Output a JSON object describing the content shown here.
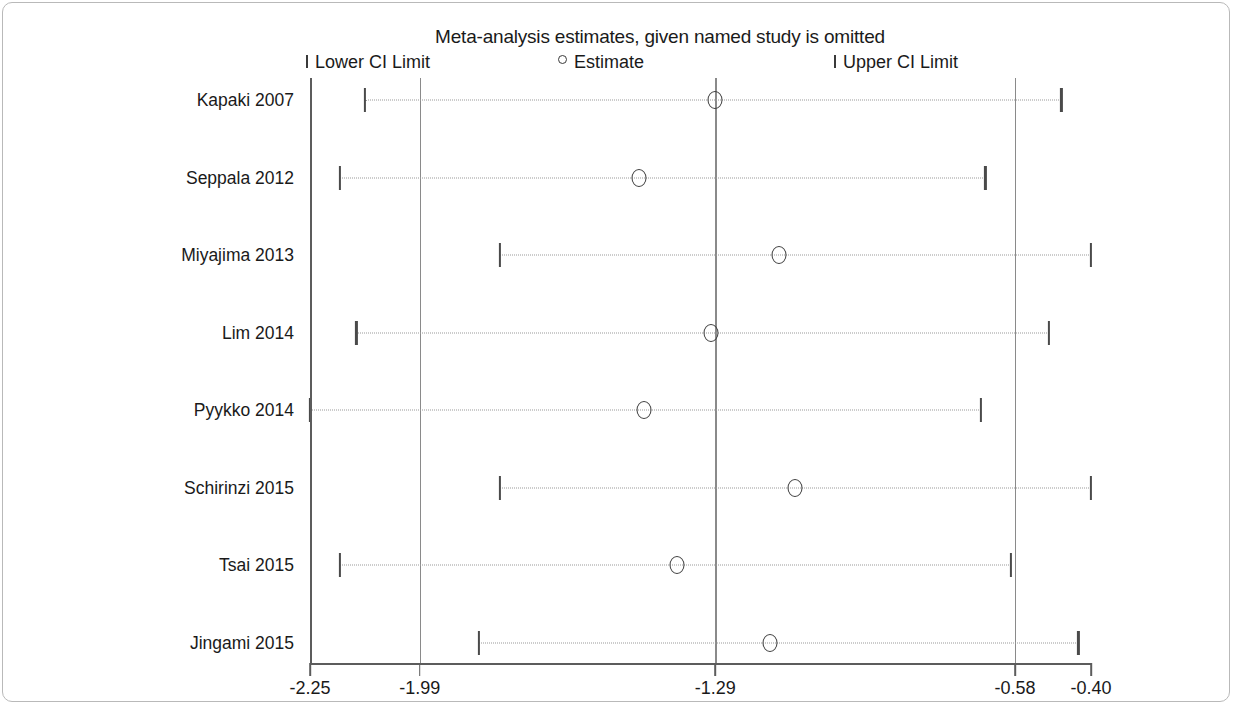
{
  "chart_data": {
    "type": "scatter",
    "title": "Meta-analysis estimates, given named study is omitted",
    "subtype": "leave-one-out influence plot",
    "xlabel": "",
    "ylabel": "",
    "grid": false,
    "legend_position": "top",
    "legend": [
      {
        "marker": "tick",
        "label": "Lower CI Limit"
      },
      {
        "marker": "circle",
        "label": "Estimate"
      },
      {
        "marker": "tick",
        "label": "Upper CI Limit"
      }
    ],
    "xlim": [
      -2.25,
      -0.4
    ],
    "xticks": [
      -2.25,
      -1.99,
      -1.29,
      -0.58,
      -0.4
    ],
    "xtick_labels": [
      "-2.25",
      "-1.99",
      "-1.29",
      "-0.58",
      "-0.40"
    ],
    "reference_lines": [
      -1.99,
      -1.29,
      -0.58
    ],
    "categories": [
      "Kapaki 2007",
      "Seppala 2012",
      "Miyajima 2013",
      "Lim 2014",
      "Pyykko 2014",
      "Schirinzi 2015",
      "Tsai 2015",
      "Jingami 2015"
    ],
    "series": [
      {
        "name": "Estimate",
        "values": [
          -1.29,
          -1.47,
          -1.14,
          -1.3,
          -1.46,
          -1.1,
          -1.38,
          -1.16
        ]
      },
      {
        "name": "Lower CI Limit",
        "values": [
          -2.12,
          -2.18,
          -1.8,
          -2.14,
          -2.25,
          -1.8,
          -2.18,
          -1.85
        ]
      },
      {
        "name": "Upper CI Limit",
        "values": [
          -0.47,
          -0.65,
          -0.4,
          -0.5,
          -0.66,
          -0.4,
          -0.59,
          -0.43
        ]
      }
    ],
    "points": [
      {
        "study": "Kapaki 2007",
        "estimate": -1.29,
        "lower": -2.12,
        "upper": -0.47
      },
      {
        "study": "Seppala 2012",
        "estimate": -1.47,
        "lower": -2.18,
        "upper": -0.65
      },
      {
        "study": "Miyajima 2013",
        "estimate": -1.14,
        "lower": -1.8,
        "upper": -0.4
      },
      {
        "study": "Lim 2014",
        "estimate": -1.3,
        "lower": -2.14,
        "upper": -0.5
      },
      {
        "study": "Pyykko 2014",
        "estimate": -1.46,
        "lower": -2.25,
        "upper": -0.66
      },
      {
        "study": "Schirinzi 2015",
        "estimate": -1.1,
        "lower": -1.8,
        "upper": -0.4
      },
      {
        "study": "Tsai 2015",
        "estimate": -1.38,
        "lower": -2.18,
        "upper": -0.59
      },
      {
        "study": "Jingami 2015",
        "estimate": -1.16,
        "lower": -1.85,
        "upper": -0.43
      }
    ]
  }
}
